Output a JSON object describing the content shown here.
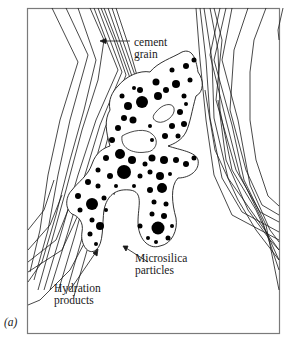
{
  "figure": {
    "panel_label": "(a)",
    "labels": {
      "cement_grain": [
        "cement",
        "grain"
      ],
      "microsilica": [
        "Microsilica",
        "particles"
      ],
      "hydration": [
        "Hydration",
        "products"
      ]
    },
    "colors": {
      "frame": "#7a7a7a",
      "lines": "#1a1a1a",
      "particles": "#000000",
      "background": "#ffffff"
    }
  }
}
